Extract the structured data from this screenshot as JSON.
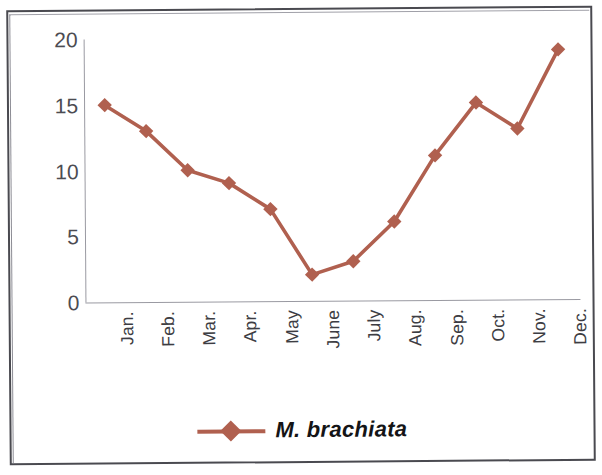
{
  "chart_data": {
    "type": "line",
    "title": "",
    "subtitle": "",
    "xlabel": "",
    "ylabel": "",
    "categories": [
      "Jan.",
      "Feb.",
      "Mar.",
      "Apr.",
      "May",
      "June",
      "July",
      "Aug.",
      "Sep.",
      "Oct.",
      "Nov.",
      "Dec."
    ],
    "series": [
      {
        "name": "M. brachiata",
        "values": [
          15,
          13,
          10,
          9,
          7,
          2,
          3,
          6,
          11,
          15,
          13,
          19
        ],
        "color": "#b0604f",
        "marker": "diamond"
      }
    ],
    "ylim": [
      0,
      20
    ],
    "yticks": [
      0,
      5,
      10,
      15,
      20
    ],
    "ytick_labels": [
      "0",
      "5",
      "10",
      "15",
      "20"
    ],
    "grid": false,
    "legend_position": "bottom",
    "xtick_rotation": -90
  },
  "legend": {
    "entries": [
      {
        "label": "M. brachiata",
        "color": "#b0604f",
        "marker": "diamond"
      }
    ]
  },
  "axes": {
    "y_axis_color": "#9a9aa2",
    "x_axis_color": "#9a9aa2",
    "tick_text_color": "#4c4c52"
  },
  "frame": {
    "border_color": "#4a4a50",
    "background": "#ffffff"
  }
}
